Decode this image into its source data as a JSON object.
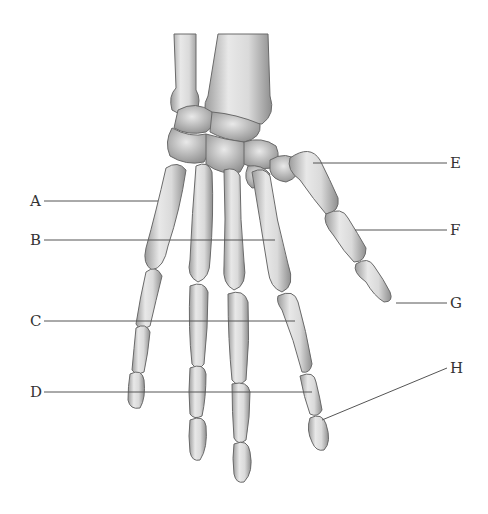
{
  "figure": {
    "labels": [
      {
        "id": "A",
        "text": "A",
        "x": 30,
        "y": 194,
        "line": [
          44,
          201,
          158,
          201
        ]
      },
      {
        "id": "B",
        "text": "B",
        "x": 30,
        "y": 233,
        "line": [
          44,
          240,
          275,
          240
        ]
      },
      {
        "id": "C",
        "text": "C",
        "x": 30,
        "y": 314,
        "line": [
          44,
          321,
          295,
          321
        ]
      },
      {
        "id": "D",
        "text": "D",
        "x": 30,
        "y": 385,
        "line": [
          44,
          392,
          312,
          392
        ]
      },
      {
        "id": "E",
        "text": "E",
        "x": 450,
        "y": 156,
        "line": [
          313,
          163,
          447,
          163
        ]
      },
      {
        "id": "F",
        "text": "F",
        "x": 450,
        "y": 223,
        "line": [
          355,
          230,
          447,
          230
        ]
      },
      {
        "id": "G",
        "text": "G",
        "x": 450,
        "y": 296,
        "line": [
          396,
          303,
          447,
          303
        ]
      },
      {
        "id": "H",
        "text": "H",
        "x": 450,
        "y": 361,
        "line": [
          322,
          420,
          447,
          368
        ]
      }
    ],
    "colors": {
      "bone": "#e4e4e4",
      "bone_shade": "#a9a9a9",
      "outline": "#6a6a6a",
      "leader": "#555555",
      "text": "#333333"
    }
  }
}
